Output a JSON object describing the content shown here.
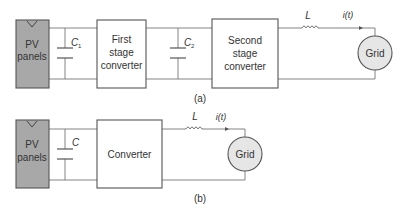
{
  "diagram_a": {
    "pv_label_1": "PV",
    "pv_label_2": "panels",
    "cap1_label": "C",
    "cap1_sub": "1",
    "first_stage_1": "First",
    "first_stage_2": "stage",
    "first_stage_3": "converter",
    "cap2_label": "C",
    "cap2_sub": "2",
    "second_stage_1": "Second",
    "second_stage_2": "stage",
    "second_stage_3": "converter",
    "inductor_label": "L",
    "current_label": "i(t)",
    "grid_label": "Grid",
    "caption": "(a)"
  },
  "diagram_b": {
    "pv_label_1": "PV",
    "pv_label_2": "panels",
    "cap_label": "C",
    "converter_label": "Converter",
    "inductor_label": "L",
    "current_label": "i(t)",
    "grid_label": "Grid",
    "caption": "(b)"
  }
}
